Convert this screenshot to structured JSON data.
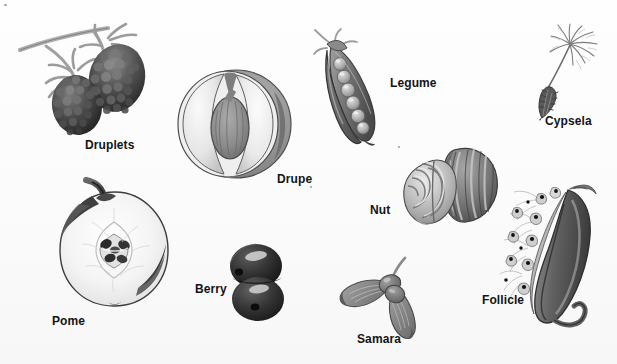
{
  "figure": {
    "background_color": "#fdfdfd",
    "width": 617,
    "height": 364,
    "style": "grayscale botanical illustration plate",
    "label_color": "#141414"
  },
  "specimens": [
    {
      "id": "druplets",
      "label": "Druplets",
      "description": "Two blackberries on a woody stem with sepals",
      "label_x": 85,
      "label_y": 138,
      "art_x": 16,
      "art_y": 22,
      "art_w": 134,
      "art_h": 118,
      "tone_dark": "#3b3b3b",
      "tone_mid": "#6f6f6f",
      "tone_light": "#a8a8a8"
    },
    {
      "id": "drupe",
      "label": "Drupe",
      "description": "Peach cut in half showing the single hard pit",
      "label_x": 277,
      "label_y": 172,
      "art_x": 166,
      "art_y": 66,
      "art_w": 128,
      "art_h": 116,
      "tone_dark": "#6e6e6e",
      "tone_mid": "#9d9d9d",
      "tone_light": "#dedede"
    },
    {
      "id": "pome",
      "label": "Pome",
      "description": "Apple cut in half showing core and seeds with stem",
      "label_x": 52,
      "label_y": 314,
      "art_x": 52,
      "art_y": 182,
      "art_w": 126,
      "art_h": 132,
      "tone_dark": "#4a4a4a",
      "tone_mid": "#9a9a9a",
      "tone_light": "#f2f2f2"
    },
    {
      "id": "berry",
      "label": "Berry",
      "description": "Two dark grapes with glossy highlights",
      "label_x": 195,
      "label_y": 282,
      "art_x": 222,
      "art_y": 242,
      "art_w": 68,
      "art_h": 80,
      "tone_dark": "#2e2e2e",
      "tone_mid": "#555555",
      "tone_light": "#c4c4c4"
    },
    {
      "id": "legume",
      "label": "Legume",
      "description": "Open pea pod with a row of round peas",
      "label_x": 390,
      "label_y": 76,
      "art_x": 313,
      "art_y": 28,
      "art_w": 76,
      "art_h": 122,
      "tone_dark": "#5c5c5c",
      "tone_mid": "#8d8d8d",
      "tone_light": "#c9c9c9"
    },
    {
      "id": "cypsela",
      "label": "Cypsela",
      "description": "Dandelion fruit with feathery pappus parachute",
      "label_x": 545,
      "label_y": 114,
      "art_x": 520,
      "art_y": 24,
      "art_w": 82,
      "art_h": 96,
      "tone_dark": "#4f4f4f",
      "tone_mid": "#8a8a8a",
      "tone_light": "#bfbfbf"
    },
    {
      "id": "nut",
      "label": "Nut",
      "description": "Walnut shell half beside the wrinkled kernel",
      "label_x": 370,
      "label_y": 203,
      "art_x": 398,
      "art_y": 140,
      "art_w": 104,
      "art_h": 88,
      "tone_dark": "#5a5a5a",
      "tone_mid": "#949494",
      "tone_light": "#d6d6d6"
    },
    {
      "id": "samara",
      "label": "Samara",
      "description": "Paired winged maple fruit",
      "label_x": 357,
      "label_y": 332,
      "art_x": 337,
      "art_y": 258,
      "art_w": 102,
      "art_h": 86,
      "tone_dark": "#6a6a6a",
      "tone_mid": "#8f8f8f",
      "tone_light": "#b6b6b6"
    },
    {
      "id": "follicle",
      "label": "Follicle",
      "description": "Split milkweed pod releasing plumed seeds",
      "label_x": 482,
      "label_y": 293,
      "art_x": 494,
      "art_y": 184,
      "art_w": 118,
      "art_h": 158,
      "tone_dark": "#555555",
      "tone_mid": "#8b8b8b",
      "tone_light": "#d0d0d0"
    }
  ]
}
